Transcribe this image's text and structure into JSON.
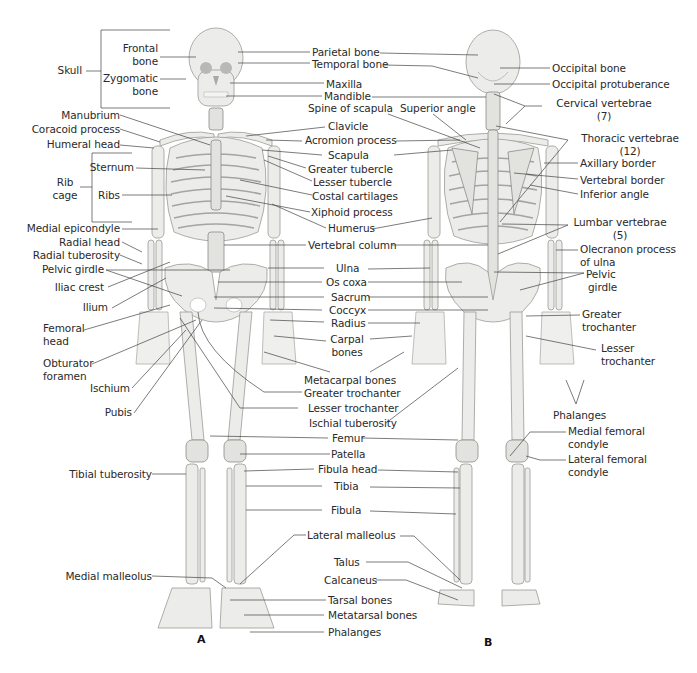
{
  "figure": {
    "panel_a_label": "A",
    "panel_b_label": "B",
    "colors": {
      "background": "#ffffff",
      "bone": "#ececea",
      "bone_outline": "#9a9a96",
      "text": "#2a2a2a",
      "leader_line": "#444444"
    }
  },
  "left_labels": {
    "skull": "Skull",
    "frontal_bone": [
      "Frontal",
      "bone"
    ],
    "zygomatic_bone": [
      "Zygomatic",
      "bone"
    ],
    "manubrium": "Manubrium",
    "coracoid_process": "Coracoid process",
    "humeral_head": "Humeral head",
    "rib_cage": [
      "Rib",
      "cage"
    ],
    "sternum": "Sternum",
    "ribs": "Ribs",
    "medial_epicondyle": "Medial epicondyle",
    "radial_head": "Radial head",
    "radial_tuberosity": "Radial tuberosity",
    "pelvic_girdle": "Pelvic girdle",
    "iliac_crest": "Iliac crest",
    "ilium": "Ilium",
    "femoral_head": [
      "Femoral",
      "head"
    ],
    "obturator_foramen": [
      "Obturator",
      "foramen"
    ],
    "ischium": "Ischium",
    "pubis": "Pubis",
    "tibial_tuberosity": "Tibial tuberosity",
    "medial_malleolus": "Medial malleolus"
  },
  "center_labels": {
    "parietal_bone": "Parietal bone",
    "temporal_bone": "Temporal bone",
    "maxilla": "Maxilla",
    "mandible": "Mandible",
    "spine_of_scapula": "Spine of scapula",
    "clavicle": "Clavicle",
    "acromion_process": "Acromion process",
    "scapula": "Scapula",
    "greater_tubercle": "Greater tubercle",
    "lesser_tubercle": "Lesser tubercle",
    "costal_cartilages": "Costal cartilages",
    "xiphoid_process": "Xiphoid process",
    "humerus": "Humerus",
    "vertebral_column": "Vertebral column",
    "ulna": "Ulna",
    "os_coxa": "Os coxa",
    "sacrum": "Sacrum",
    "coccyx": "Coccyx",
    "radius": "Radius",
    "carpal_bones": [
      "Carpal",
      "bones"
    ],
    "metacarpal_bones": "Metacarpal bones",
    "greater_trochanter": "Greater trochanter",
    "lesser_trochanter": "Lesser trochanter",
    "ischial_tuberosity": "Ischial tuberosity",
    "femur": "Femur",
    "patella": "Patella",
    "fibula_head": "Fibula head",
    "tibia": "Tibia",
    "fibula": "Fibula",
    "lateral_malleolus": "Lateral malleolus",
    "talus": "Talus",
    "calcaneus": "Calcaneus",
    "tarsal_bones": "Tarsal bones",
    "metatarsal_bones": "Metatarsal bones",
    "phalanges": "Phalanges"
  },
  "right_labels": {
    "superior_angle": "Superior angle",
    "occipital_bone": "Occipital bone",
    "occipital_protuberance": "Occipital protuberance",
    "cervical_vertebrae": [
      "Cervical vertebrae",
      "(7)"
    ],
    "thoracic_vertebrae": [
      "Thoracic vertebrae",
      "(12)"
    ],
    "axillary_border": "Axillary border",
    "vertebral_border": "Vertebral border",
    "inferior_angle": "Inferior angle",
    "lumbar_vertebrae": [
      "Lumbar vertebrae",
      "(5)"
    ],
    "olecranon_process": [
      "Olecranon process",
      "of ulna"
    ],
    "pelvic_girdle": [
      "Pelvic",
      "girdle"
    ],
    "greater_trochanter": [
      "Greater",
      "trochanter"
    ],
    "lesser_trochanter": [
      "Lesser",
      "trochanter"
    ],
    "phalanges": "Phalanges",
    "medial_femoral_condyle": [
      "Medial femoral",
      "condyle"
    ],
    "lateral_femoral_condyle": [
      "Lateral femoral",
      "condyle"
    ]
  }
}
